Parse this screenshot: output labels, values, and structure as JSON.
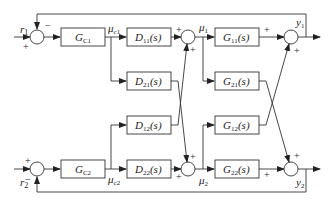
{
  "diagram": {
    "type": "block-diagram",
    "inputs": {
      "r1": "r",
      "r1_sub": "1",
      "r2": "r",
      "r2_sub": "2"
    },
    "controllers": [
      {
        "id": "GC1",
        "main": "G",
        "sub": "C1"
      },
      {
        "id": "GC2",
        "main": "G",
        "sub": "C2"
      }
    ],
    "controller_outputs": [
      {
        "main": "μ",
        "sub": "c1"
      },
      {
        "main": "μ",
        "sub": "c2"
      }
    ],
    "decouplers": [
      {
        "id": "D11",
        "main": "D",
        "sub": "11",
        "arg": "(s)"
      },
      {
        "id": "D21",
        "main": "D",
        "sub": "21",
        "arg": "(s)"
      },
      {
        "id": "D12",
        "main": "D",
        "sub": "12",
        "arg": "(s)"
      },
      {
        "id": "D22",
        "main": "D",
        "sub": "22",
        "arg": "(s)"
      }
    ],
    "manipulated": [
      {
        "main": "μ",
        "sub": "1"
      },
      {
        "main": "μ",
        "sub": "2"
      }
    ],
    "plant": [
      {
        "id": "G11",
        "main": "G",
        "sub": "11",
        "arg": "(s)"
      },
      {
        "id": "G21",
        "main": "G",
        "sub": "21",
        "arg": "(s)"
      },
      {
        "id": "G12",
        "main": "G",
        "sub": "12",
        "arg": "(s)"
      },
      {
        "id": "G22",
        "main": "G",
        "sub": "22",
        "arg": "(s)"
      }
    ],
    "outputs": [
      {
        "main": "y",
        "sub": "1"
      },
      {
        "main": "y",
        "sub": "2"
      }
    ],
    "signs": {
      "plus": "+",
      "minus": "−"
    }
  }
}
